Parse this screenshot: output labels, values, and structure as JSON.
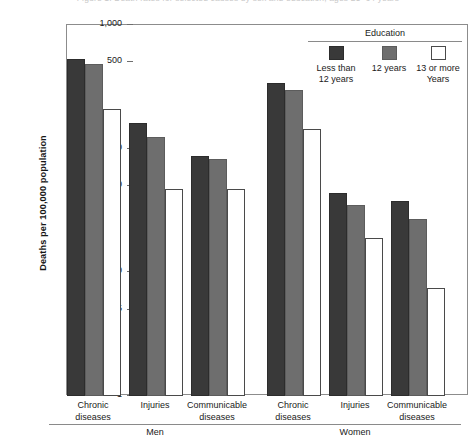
{
  "figure": {
    "cropped_title": "Figure 1. Death rates for selected causes by sex and education, ages 25–64 years",
    "ylabel": "Deaths per 100,000 population"
  },
  "legend": {
    "title": "Education",
    "items": [
      {
        "name": "less-than-12-years",
        "line1": "Less than",
        "line2": "12 years",
        "color": "#393939"
      },
      {
        "name": "12-years",
        "line1": "12 years",
        "line2": "",
        "color": "#6e6e6e"
      },
      {
        "name": "13-or-more-years",
        "line1": "13 or more",
        "line2": "Years",
        "color": "#ffffff"
      }
    ]
  },
  "axis": {
    "ticks": [
      {
        "label": "1,000",
        "value": 1000
      },
      {
        "label": "500",
        "value": 500
      },
      {
        "label": "100",
        "value": 100
      },
      {
        "label": "50",
        "value": 50
      },
      {
        "label": "10",
        "value": 10
      },
      {
        "label": "5",
        "value": 5
      },
      {
        "label": "1",
        "value": 1
      }
    ]
  },
  "sex_groups": [
    {
      "label": "Men",
      "categories": [
        0,
        1,
        2
      ]
    },
    {
      "label": "Women",
      "categories": [
        3,
        4,
        5
      ]
    }
  ],
  "chart_data": {
    "type": "bar",
    "title": "Death rates for selected causes by sex and education, ages 25–64 years",
    "xlabel": "",
    "ylabel": "Deaths per 100,000 population",
    "yscale": "log",
    "ylim": [
      1,
      1000
    ],
    "ytick_labels": [
      "1",
      "5",
      "10",
      "50",
      "100",
      "500",
      "1,000"
    ],
    "ytick_values": [
      1,
      5,
      10,
      50,
      100,
      500,
      1000
    ],
    "grid": false,
    "legend_position": "top-right",
    "legend_title": "Education",
    "group_labels": [
      "Men",
      "Women"
    ],
    "categories": [
      {
        "sex": "Men",
        "line1": "Chronic",
        "line2": "diseases"
      },
      {
        "sex": "Men",
        "line1": "Injuries",
        "line2": ""
      },
      {
        "sex": "Men",
        "line1": "Communicable",
        "line2": "diseases"
      },
      {
        "sex": "Women",
        "line1": "Chronic",
        "line2": "diseases"
      },
      {
        "sex": "Women",
        "line1": "Injuries",
        "line2": ""
      },
      {
        "sex": "Women",
        "line1": "Communicable",
        "line2": "diseases"
      }
    ],
    "series": [
      {
        "name": "Less than 12 years",
        "color": "#393939",
        "values": [
          530,
          160,
          88,
          340,
          44,
          38
        ]
      },
      {
        "name": "12 years",
        "color": "#6e6e6e",
        "values": [
          480,
          125,
          82,
          300,
          35,
          27
        ]
      },
      {
        "name": "13 or more Years",
        "color": "#ffffff",
        "values": [
          210,
          47,
          47,
          145,
          19,
          7.5
        ]
      }
    ]
  }
}
